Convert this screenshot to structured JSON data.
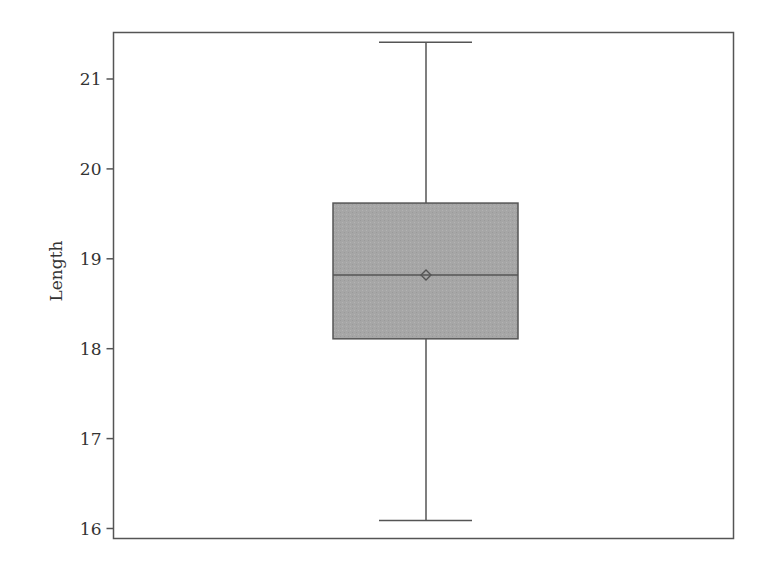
{
  "chart_data": {
    "type": "box",
    "title": "",
    "xlabel": "",
    "ylabel": "Length",
    "ylim": [
      15.88,
      21.53
    ],
    "yticks": [
      16,
      17,
      18,
      19,
      20,
      21
    ],
    "grid": false,
    "legend": null,
    "series": [
      {
        "name": "Length",
        "min": 16.09,
        "q1": 18.11,
        "median": 18.82,
        "mean": 18.82,
        "q3": 19.62,
        "max": 21.41
      }
    ],
    "colors": {
      "box_fill": "#a9a9a9",
      "line": "#555555",
      "frame": "#555555"
    }
  },
  "axis": {
    "y_label": "Length",
    "y_tick_labels": [
      "16",
      "17",
      "18",
      "19",
      "20",
      "21"
    ]
  }
}
